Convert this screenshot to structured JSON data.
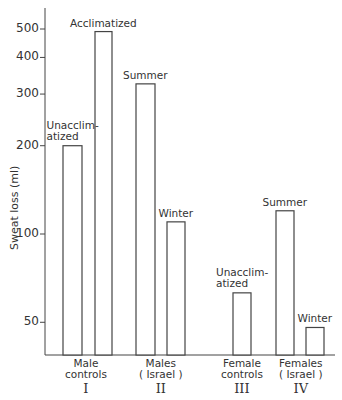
{
  "chart_data": {
    "type": "bar",
    "title": "",
    "xlabel": "",
    "ylabel": "Sweat loss (ml)",
    "yscale": "log",
    "ylim": [
      30,
      600
    ],
    "yticks": [
      50,
      100,
      200,
      300,
      400,
      500
    ],
    "grid": false,
    "legend": null,
    "groups": [
      {
        "label_line1": "Male",
        "label_line2": "controls",
        "roman": "I",
        "bars": [
          {
            "label": "Unacclim-\natized",
            "label_line1": "Unacclim-",
            "label_line2": "atized",
            "value": 200
          },
          {
            "label": "Acclimatized",
            "label_line1": "Acclimatized",
            "label_line2": "",
            "value": 490
          }
        ]
      },
      {
        "label_line1": "Males",
        "label_line2": "( Israel )",
        "roman": "II",
        "bars": [
          {
            "label": "Summer",
            "label_line1": "Summer",
            "label_line2": "",
            "value": 325
          },
          {
            "label": "Winter",
            "label_line1": "Winter",
            "label_line2": "",
            "value": 110
          }
        ]
      },
      {
        "label_line1": "Female",
        "label_line2": "controls",
        "roman": "III",
        "bars": [
          {
            "label": "Unacclim-\natized",
            "label_line1": "Unacclim-",
            "label_line2": "atized",
            "value": 63
          }
        ]
      },
      {
        "label_line1": "Females",
        "label_line2": "( Israel )",
        "roman": "IV",
        "bars": [
          {
            "label": "Summer",
            "label_line1": "Summer",
            "label_line2": "",
            "value": 120
          },
          {
            "label": "Winter",
            "label_line1": "Winter",
            "label_line2": "",
            "value": 48
          }
        ]
      }
    ],
    "categories": [
      "Male controls - Unacclimatized",
      "Male controls - Acclimatized",
      "Males (Israel) - Summer",
      "Males (Israel) - Winter",
      "Female controls - Unacclimatized",
      "Females (Israel) - Summer",
      "Females (Israel) - Winter"
    ],
    "values": [
      200,
      490,
      325,
      110,
      63,
      120,
      48
    ]
  },
  "style": {
    "line_color": "#444444",
    "bar_fill": "#ffffff",
    "text_color": "#333333"
  }
}
